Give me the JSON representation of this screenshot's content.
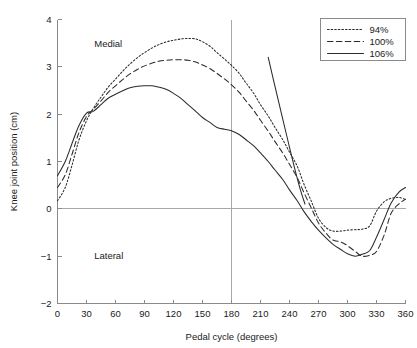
{
  "chart_data": {
    "type": "line",
    "title": "",
    "xlabel": "Pedal cycle (degrees)",
    "ylabel": "Knee joint position (cm)",
    "xlim": [
      0,
      360
    ],
    "ylim": [
      -2,
      4
    ],
    "xticks": [
      0,
      30,
      60,
      90,
      120,
      150,
      180,
      210,
      240,
      270,
      300,
      330,
      360
    ],
    "yticks": [
      -2,
      -1,
      0,
      1,
      2,
      3,
      4
    ],
    "grid": false,
    "legend_position": "top-right",
    "reference_lines": [
      {
        "name": "zero-line",
        "orientation": "horizontal",
        "value": 0
      },
      {
        "name": "mid-cycle-line",
        "orientation": "vertical",
        "value": 180
      }
    ],
    "annotations": [
      {
        "name": "medial-label",
        "text": "Medial",
        "x": 38,
        "y": 3.42
      },
      {
        "name": "lateral-label",
        "text": "Lateral",
        "x": 38,
        "y": -1.06
      }
    ],
    "series": [
      {
        "name": "94%",
        "style": "dotted",
        "x": [
          0,
          8,
          15,
          22,
          30,
          37,
          45,
          52,
          60,
          68,
          75,
          83,
          90,
          98,
          105,
          113,
          120,
          128,
          135,
          143,
          150,
          158,
          165,
          173,
          180,
          188,
          195,
          203,
          210,
          218,
          225,
          233,
          240,
          248,
          255,
          263,
          270,
          278,
          285,
          293,
          300,
          308,
          315,
          323,
          330,
          338,
          345,
          353,
          360
        ],
        "y": [
          0.17,
          0.45,
          0.92,
          1.44,
          1.86,
          2.12,
          2.36,
          2.56,
          2.74,
          2.92,
          3.06,
          3.2,
          3.3,
          3.4,
          3.47,
          3.53,
          3.56,
          3.59,
          3.6,
          3.59,
          3.53,
          3.43,
          3.3,
          3.16,
          3.03,
          2.86,
          2.66,
          2.44,
          2.2,
          1.96,
          1.72,
          1.46,
          1.2,
          0.9,
          0.52,
          0.14,
          -0.2,
          -0.4,
          -0.47,
          -0.47,
          -0.45,
          -0.44,
          -0.43,
          -0.36,
          -0.05,
          0.15,
          0.22,
          0.24,
          0.2
        ]
      },
      {
        "name": "100%",
        "style": "dashed",
        "x": [
          0,
          8,
          15,
          22,
          30,
          37,
          45,
          52,
          60,
          68,
          75,
          83,
          90,
          98,
          105,
          113,
          120,
          128,
          135,
          143,
          150,
          158,
          165,
          173,
          180,
          188,
          195,
          203,
          210,
          218,
          225,
          233,
          240,
          248,
          255,
          263,
          270,
          278,
          285,
          293,
          300,
          308,
          315,
          323,
          330,
          338,
          345,
          353,
          360
        ],
        "y": [
          0.45,
          0.72,
          1.15,
          1.6,
          1.95,
          2.1,
          2.28,
          2.45,
          2.6,
          2.74,
          2.85,
          2.95,
          3.02,
          3.08,
          3.12,
          3.14,
          3.15,
          3.15,
          3.14,
          3.1,
          3.04,
          2.96,
          2.86,
          2.74,
          2.62,
          2.46,
          2.28,
          2.08,
          1.87,
          1.64,
          1.42,
          1.18,
          0.94,
          0.66,
          0.34,
          0.0,
          -0.3,
          -0.52,
          -0.66,
          -0.7,
          -0.78,
          -0.9,
          -1.0,
          -0.98,
          -0.9,
          -0.55,
          -0.1,
          0.1,
          0.2
        ]
      },
      {
        "name": "106%",
        "style": "solid",
        "x": [
          0,
          8,
          15,
          22,
          30,
          37,
          45,
          52,
          60,
          68,
          75,
          83,
          90,
          98,
          105,
          113,
          120,
          128,
          135,
          143,
          150,
          158,
          165,
          173,
          180,
          188,
          195,
          203,
          210,
          218,
          225,
          233,
          240,
          248,
          255,
          263,
          270,
          278,
          285,
          293,
          300,
          308,
          315,
          323,
          330,
          338,
          345,
          353,
          360
        ],
        "y": [
          0.7,
          1.0,
          1.38,
          1.75,
          2.02,
          2.06,
          2.2,
          2.33,
          2.42,
          2.5,
          2.56,
          2.59,
          2.6,
          2.6,
          2.57,
          2.52,
          2.44,
          2.33,
          2.2,
          2.06,
          1.93,
          1.82,
          1.72,
          1.68,
          1.65,
          1.57,
          1.46,
          1.33,
          1.18,
          1.0,
          0.82,
          0.62,
          0.4,
          0.17,
          -0.06,
          -0.28,
          -0.45,
          -0.62,
          -0.75,
          -0.86,
          -0.95,
          -1.0,
          -0.96,
          -0.88,
          -0.6,
          -0.22,
          0.12,
          0.35,
          0.45
        ]
      },
      {
        "name": "106%-return",
        "style": "solid",
        "x": [
          218,
          224,
          231,
          238,
          245,
          251,
          256
        ],
        "y": [
          3.2,
          2.67,
          2.07,
          1.47,
          0.88,
          0.42,
          0.1
        ]
      }
    ]
  },
  "legend": {
    "items": [
      {
        "label": "94%",
        "style": "dotted"
      },
      {
        "label": "100%",
        "style": "dashed"
      },
      {
        "label": "106%",
        "style": "solid"
      }
    ]
  },
  "colors": {
    "line": "#2b2b2b",
    "axis": "#8a8a8a",
    "reference": "#a8a8a8",
    "background": "#ffffff",
    "text": "#1a1a1a"
  }
}
